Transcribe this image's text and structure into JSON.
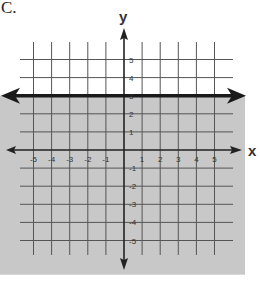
{
  "problem_label": "C.",
  "chart_data": {
    "type": "line",
    "title": "",
    "xlabel": "x",
    "ylabel": "y",
    "xlim": [
      -6,
      6
    ],
    "ylim": [
      -6,
      6
    ],
    "grid": true,
    "x_ticks": [
      -5,
      -4,
      -3,
      -2,
      -1,
      1,
      2,
      3,
      4,
      5
    ],
    "y_ticks": [
      5,
      4,
      3,
      2,
      1,
      -1,
      -2,
      -3,
      -4,
      -5
    ],
    "x_tick_labels": [
      "-5",
      "-4",
      "-3",
      "-2",
      "-1",
      "1",
      "2",
      "3",
      "4",
      "5"
    ],
    "y_tick_labels": [
      "5",
      "4",
      "3",
      "2",
      "1",
      "-1",
      "-2",
      "-3",
      "-4",
      "-5"
    ],
    "series": [
      {
        "name": "boundary",
        "equation": "y = 3",
        "style": "solid",
        "x": [
          -6.5,
          6.5
        ],
        "y": [
          3,
          3
        ]
      }
    ],
    "shaded_region": {
      "relation": "y <= 3",
      "side": "below",
      "color": "#c8c8c8"
    },
    "colors": {
      "shade": "#c8c8c8",
      "axes": "#222222",
      "grid": "#555555",
      "boundary": "#1a1a1a"
    }
  }
}
